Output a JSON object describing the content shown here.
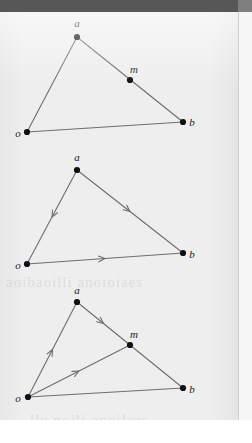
{
  "figure": {
    "kind": "geometry-diagram",
    "stroke_color": "#6d6d73",
    "point_color": "#101010",
    "paper_color": "#eeeeee",
    "scanbar_color": "#575757"
  },
  "ghost_text": {
    "line_1": "aoibaoilli anoioiaes",
    "line_2": "llu noili onoilaes"
  },
  "panels": [
    {
      "id": "panel-1",
      "name": "triangle-plain",
      "points": [
        {
          "id": "a",
          "label": "a",
          "x": 77,
          "y": 37,
          "lx": 77,
          "ly": 23
        },
        {
          "id": "o",
          "label": "o",
          "x": 27,
          "y": 132,
          "lx": 18,
          "ly": 133
        },
        {
          "id": "b",
          "label": "b",
          "x": 183,
          "y": 122,
          "lx": 192,
          "ly": 122
        },
        {
          "id": "m",
          "label": "m",
          "x": 130,
          "y": 80,
          "lx": 134,
          "ly": 69
        }
      ],
      "segments": [
        {
          "id": "oa",
          "from": "o",
          "to": "a",
          "arrow": false
        },
        {
          "id": "ab",
          "from": "a",
          "to": "b",
          "arrow": false
        },
        {
          "id": "ob",
          "from": "o",
          "to": "b",
          "arrow": false
        }
      ]
    },
    {
      "id": "panel-2",
      "name": "triangle-directed",
      "points": [
        {
          "id": "a",
          "label": "a",
          "x": 77,
          "y": 170,
          "lx": 77,
          "ly": 157
        },
        {
          "id": "o",
          "label": "o",
          "x": 27,
          "y": 264,
          "lx": 18,
          "ly": 265
        },
        {
          "id": "b",
          "label": "b",
          "x": 183,
          "y": 253,
          "lx": 192,
          "ly": 254
        }
      ],
      "segments": [
        {
          "id": "a-to-o",
          "from": "a",
          "to": "o",
          "arrow": true
        },
        {
          "id": "a-to-b",
          "from": "a",
          "to": "b",
          "arrow": true
        },
        {
          "id": "o-to-b",
          "from": "o",
          "to": "b",
          "arrow": true
        }
      ]
    },
    {
      "id": "panel-3",
      "name": "triangle-with-midpoint-vectors",
      "points": [
        {
          "id": "a",
          "label": "a",
          "x": 77,
          "y": 302,
          "lx": 77,
          "ly": 290
        },
        {
          "id": "o",
          "label": "o",
          "x": 28,
          "y": 397,
          "lx": 18,
          "ly": 398
        },
        {
          "id": "b",
          "label": "b",
          "x": 183,
          "y": 388,
          "lx": 192,
          "ly": 389
        },
        {
          "id": "m",
          "label": "m",
          "x": 130,
          "y": 345,
          "lx": 134,
          "ly": 334
        }
      ],
      "segments": [
        {
          "id": "o-to-a",
          "from": "o",
          "to": "a",
          "arrow": true
        },
        {
          "id": "a-to-m",
          "from": "a",
          "to": "m",
          "arrow": true
        },
        {
          "id": "o-to-m",
          "from": "o",
          "to": "m",
          "arrow": true
        },
        {
          "id": "m-to-b",
          "from": "m",
          "to": "b",
          "arrow": false
        },
        {
          "id": "o-to-b",
          "from": "o",
          "to": "b",
          "arrow": false
        }
      ]
    }
  ]
}
